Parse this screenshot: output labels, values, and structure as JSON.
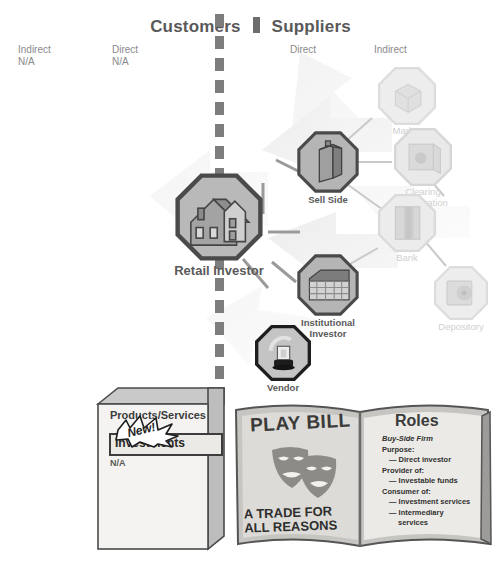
{
  "header": {
    "customers": "Customers",
    "suppliers": "Suppliers",
    "columns": [
      {
        "name": "customers-indirect",
        "label": "Indirect",
        "value": "N/A",
        "x": 18,
        "y": 44
      },
      {
        "name": "customers-direct",
        "label": "Direct",
        "value": "N/A",
        "x": 112,
        "y": 44
      },
      {
        "name": "suppliers-direct",
        "label": "Direct",
        "value": "",
        "x": 290,
        "y": 44
      },
      {
        "name": "suppliers-indirect",
        "label": "Indirect",
        "value": "",
        "x": 374,
        "y": 44
      }
    ]
  },
  "nodes": [
    {
      "name": "retail-investor",
      "label": "Retail Investor",
      "icon": "house-icon",
      "x": 175,
      "y": 173,
      "size": 88,
      "labelY": 92,
      "labelX": -11,
      "state": "active",
      "border": "dark"
    },
    {
      "name": "sell-side",
      "label": "Sell Side",
      "icon": "office-tower-icon",
      "x": 297,
      "y": 131,
      "size": 62,
      "labelY": 63,
      "labelX": -24,
      "state": "active",
      "border": "dark"
    },
    {
      "name": "institutional-investor",
      "label": "Institutional\nInvestor",
      "icon": "warehouse-icon",
      "x": 297,
      "y": 254,
      "size": 62,
      "labelY": 63,
      "labelX": -24,
      "state": "active",
      "border": "dark"
    },
    {
      "name": "vendor",
      "label": "Vendor",
      "icon": "lamp-icon",
      "x": 255,
      "y": 325,
      "size": 56,
      "labelY": 57,
      "labelX": -27,
      "state": "active",
      "border": "darker"
    },
    {
      "name": "market",
      "label": "Market",
      "icon": "cube-icon",
      "x": 378,
      "y": 67,
      "size": 58,
      "labelY": 58,
      "labelX": -26,
      "state": "faded",
      "border": "light"
    },
    {
      "name": "clearing-corporation",
      "label": "Clearing\nCorporation",
      "icon": "vault-door-icon",
      "x": 394,
      "y": 128,
      "size": 58,
      "labelY": 58,
      "labelX": -26,
      "state": "faded",
      "border": "light"
    },
    {
      "name": "bank",
      "label": "Bank",
      "icon": "bank-building-icon",
      "x": 378,
      "y": 194,
      "size": 58,
      "labelY": 58,
      "labelX": -26,
      "state": "faded",
      "border": "light"
    },
    {
      "name": "depository",
      "label": "Depository",
      "icon": "safe-icon",
      "x": 434,
      "y": 266,
      "size": 54,
      "labelY": 55,
      "labelX": -28,
      "state": "faded",
      "border": "light"
    }
  ],
  "products_box": {
    "heading": "Products/Services",
    "highlight": "Investments",
    "badge": "New!",
    "value": "N/A"
  },
  "playbill": {
    "title": "PLAY BILL",
    "tagline_line1": "A TRADE FOR",
    "tagline_line2": "ALL REASONS",
    "masks_icon": "theater-masks-icon",
    "roles_title": "Roles",
    "roles": [
      {
        "text": "Buy-Side Firm",
        "style": "italic"
      },
      {
        "text": "Purpose:",
        "style": "plain"
      },
      {
        "text": "— Direct investor",
        "style": "indent"
      },
      {
        "text": "Provider of:",
        "style": "plain"
      },
      {
        "text": "— Investable funds",
        "style": "indent"
      },
      {
        "text": "Consumer of:",
        "style": "plain"
      },
      {
        "text": "— Investment services",
        "style": "indent"
      },
      {
        "text": "— Intermediary",
        "style": "indent"
      },
      {
        "text": "services",
        "style": "indent2"
      }
    ]
  },
  "colors": {
    "node_fill": "#b9b9b9",
    "node_border": "#4f4f4f",
    "faded_fill": "#e4e4e4",
    "faded_border": "#d6d6d6",
    "divider": "#7d7d7d",
    "title": "#595959"
  },
  "caption": ""
}
